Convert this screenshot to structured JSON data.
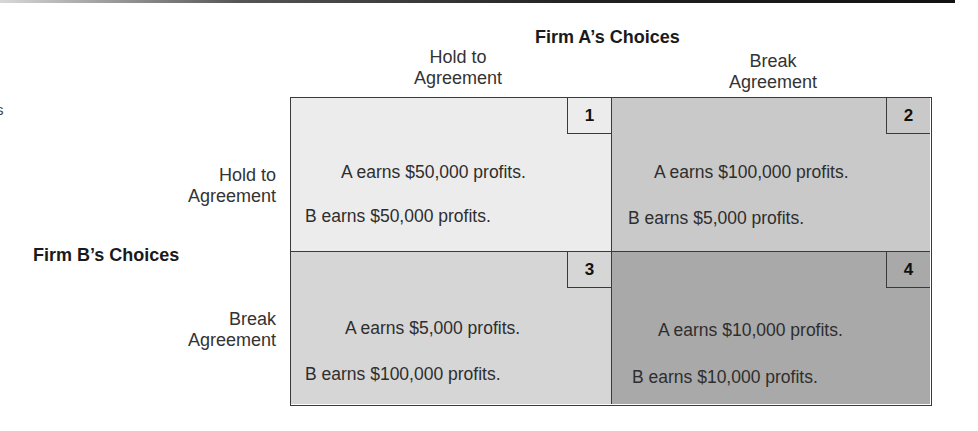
{
  "page": {
    "edge_fragment": "s"
  },
  "colors": {
    "cell_1_fill": "#ececec",
    "cell_2_fill": "#c9c9c9",
    "cell_3_fill": "#d6d6d6",
    "cell_4_fill": "#a9a9a9",
    "border": "#3a3a3a"
  },
  "firm_a": {
    "title": "Firm A’s Choices",
    "columns": [
      {
        "line1": "Hold to",
        "line2": "Agreement"
      },
      {
        "line1": "Break",
        "line2": "Agreement"
      }
    ]
  },
  "firm_b": {
    "title": "Firm B’s Choices",
    "rows": [
      {
        "line1": "Hold to",
        "line2": "Agreement"
      },
      {
        "line1": "Break",
        "line2": "Agreement"
      }
    ]
  },
  "matrix": {
    "cells": [
      {
        "number": "1",
        "a_text": "A earns $50,000 profits.",
        "b_text": "B earns $50,000 profits.",
        "a_profit": 50000,
        "b_profit": 50000
      },
      {
        "number": "2",
        "a_text": "A earns $100,000 profits.",
        "b_text": "B earns $5,000 profits.",
        "a_profit": 100000,
        "b_profit": 5000
      },
      {
        "number": "3",
        "a_text": "A earns $5,000 profits.",
        "b_text": "B earns $100,000 profits.",
        "a_profit": 5000,
        "b_profit": 100000
      },
      {
        "number": "4",
        "a_text": "A earns $10,000 profits.",
        "b_text": "B earns $10,000 profits.",
        "a_profit": 10000,
        "b_profit": 10000
      }
    ]
  }
}
